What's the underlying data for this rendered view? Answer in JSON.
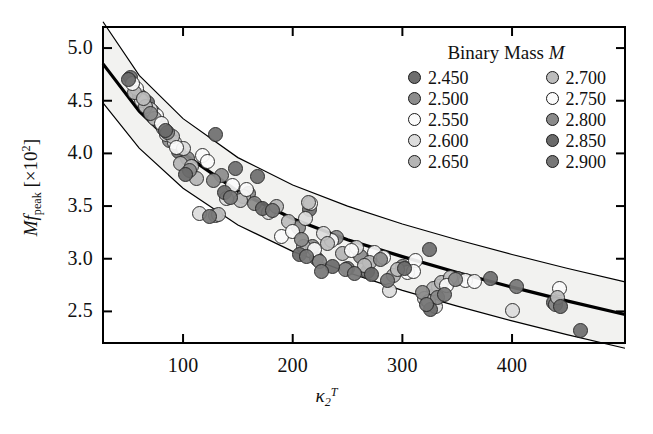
{
  "figure": {
    "background_color": "#ffffff",
    "frame_color": "#000000",
    "band_fill_color": "#f2f2f0",
    "fit_line_color": "#000000"
  },
  "axes": {
    "x": {
      "label_text": "κ",
      "label_sub": "2",
      "label_sup": "T",
      "ticks": [
        100,
        200,
        300,
        400
      ],
      "tick_labels": [
        "100",
        "200",
        "300",
        "400"
      ],
      "range": [
        27,
        503
      ]
    },
    "y": {
      "label_prefix": "M",
      "label_f": "f",
      "label_sub": "peak",
      "label_bracket_open": "[",
      "label_times": "×10",
      "label_exp": "2",
      "label_bracket_close": "]",
      "ticks": [
        2.5,
        3.0,
        3.5,
        4.0,
        4.5,
        5.0
      ],
      "tick_labels": [
        "2.5",
        "3.0",
        "3.5",
        "4.0",
        "4.5",
        "5.0"
      ],
      "range": [
        2.2,
        5.2
      ]
    }
  },
  "legend": {
    "title": "Binary Mass ",
    "title_italic": "M",
    "columns": [
      {
        "entries": [
          {
            "label": "2.450",
            "color": "#6e6e6e"
          },
          {
            "label": "2.500",
            "color": "#8c8c8c"
          },
          {
            "label": "2.550",
            "color": "#fbfbfb"
          },
          {
            "label": "2.600",
            "color": "#dddddd"
          },
          {
            "label": "2.650",
            "color": "#b5b5b5"
          }
        ]
      },
      {
        "entries": [
          {
            "label": "2.700",
            "color": "#bcbcbc"
          },
          {
            "label": "2.750",
            "color": "#fbfbfb"
          },
          {
            "label": "2.800",
            "color": "#8a8a8a"
          },
          {
            "label": "2.850",
            "color": "#6a6a6a"
          },
          {
            "label": "2.900",
            "color": "#777777"
          }
        ]
      }
    ]
  },
  "chart_data": {
    "type": "scatter",
    "title": "",
    "xlabel": "kappa_2^T",
    "ylabel": "M f_peak [x10^2]",
    "xlim": [
      27,
      503
    ],
    "ylim": [
      2.2,
      5.2
    ],
    "grid": false,
    "legend_position": "top-right",
    "legend_title": "Binary Mass M",
    "color_scale": "grayscale by binary mass M (solar masses)",
    "series": [
      {
        "name": "2.450",
        "color": "#6e6e6e",
        "points": [
          [
            52,
            4.72
          ],
          [
            68,
            4.48
          ],
          [
            78,
            4.3
          ],
          [
            96,
            4.02
          ],
          [
            130,
            4.18
          ],
          [
            148,
            3.86
          ],
          [
            168,
            3.78
          ],
          [
            215,
            3.47
          ],
          [
            222,
            3.0
          ],
          [
            250,
            2.91
          ],
          [
            268,
            2.88
          ],
          [
            325,
            3.09
          ],
          [
            380,
            2.81
          ],
          [
            438,
            2.58
          ],
          [
            462,
            2.32
          ]
        ]
      },
      {
        "name": "2.500",
        "color": "#8c8c8c",
        "points": [
          [
            60,
            4.55
          ],
          [
            72,
            4.4
          ],
          [
            88,
            4.12
          ],
          [
            104,
            3.95
          ],
          [
            135,
            3.79
          ],
          [
            160,
            3.62
          ],
          [
            205,
            3.3
          ],
          [
            218,
            3.12
          ],
          [
            240,
            3.2
          ],
          [
            262,
            3.02
          ],
          [
            300,
            2.93
          ],
          [
            330,
            2.66
          ],
          [
            350,
            2.81
          ],
          [
            440,
            2.57
          ]
        ]
      },
      {
        "name": "2.550",
        "color": "#fbfbfb",
        "points": [
          [
            58,
            4.62
          ],
          [
            76,
            4.36
          ],
          [
            92,
            4.1
          ],
          [
            118,
            3.98
          ],
          [
            145,
            3.7
          ],
          [
            190,
            3.21
          ],
          [
            216,
            3.52
          ],
          [
            235,
            3.17
          ],
          [
            275,
            3.06
          ],
          [
            305,
            2.87
          ],
          [
            312,
            2.98
          ],
          [
            333,
            2.74
          ],
          [
            358,
            2.79
          ],
          [
            443,
            2.72
          ]
        ]
      },
      {
        "name": "2.600",
        "color": "#dddddd",
        "points": [
          [
            62,
            4.5
          ],
          [
            70,
            4.42
          ],
          [
            85,
            4.18
          ],
          [
            100,
            4.05
          ],
          [
            115,
            3.43
          ],
          [
            140,
            3.57
          ],
          [
            178,
            3.44
          ],
          [
            212,
            3.38
          ],
          [
            228,
            3.24
          ],
          [
            258,
            3.11
          ],
          [
            288,
            2.7
          ],
          [
            320,
            2.62
          ],
          [
            330,
            2.55
          ],
          [
            400,
            2.51
          ]
        ]
      },
      {
        "name": "2.650",
        "color": "#b5b5b5",
        "points": [
          [
            56,
            4.58
          ],
          [
            66,
            4.45
          ],
          [
            82,
            4.24
          ],
          [
            98,
            3.9
          ],
          [
            112,
            3.76
          ],
          [
            130,
            3.41
          ],
          [
            155,
            3.59
          ],
          [
            185,
            3.5
          ],
          [
            210,
            3.12
          ],
          [
            245,
            3.05
          ],
          [
            270,
            2.96
          ],
          [
            292,
            2.84
          ],
          [
            328,
            2.72
          ],
          [
            336,
            2.77
          ]
        ]
      },
      {
        "name": "2.700",
        "color": "#bcbcbc",
        "points": [
          [
            64,
            4.52
          ],
          [
            74,
            4.33
          ],
          [
            90,
            4.16
          ],
          [
            108,
            3.88
          ],
          [
            132,
            3.42
          ],
          [
            152,
            3.55
          ],
          [
            196,
            3.35
          ],
          [
            214,
            3.53
          ],
          [
            232,
            3.14
          ],
          [
            265,
            2.94
          ],
          [
            296,
            2.9
          ],
          [
            324,
            2.59
          ],
          [
            344,
            2.82
          ],
          [
            441,
            2.63
          ]
        ]
      },
      {
        "name": "2.750",
        "color": "#fbfbfb",
        "points": [
          [
            54,
            4.66
          ],
          [
            80,
            4.28
          ],
          [
            94,
            4.06
          ],
          [
            122,
            3.92
          ],
          [
            158,
            3.66
          ],
          [
            200,
            3.26
          ],
          [
            220,
            3.09
          ],
          [
            254,
            3.08
          ],
          [
            283,
            3.01
          ],
          [
            310,
            2.88
          ],
          [
            340,
            2.75
          ],
          [
            366,
            2.78
          ]
        ]
      },
      {
        "name": "2.800",
        "color": "#8a8a8a",
        "points": [
          [
            70,
            4.38
          ],
          [
            86,
            4.2
          ],
          [
            106,
            3.84
          ],
          [
            128,
            3.74
          ],
          [
            165,
            3.52
          ],
          [
            208,
            3.18
          ],
          [
            224,
            2.97
          ],
          [
            248,
            2.9
          ],
          [
            280,
            2.99
          ],
          [
            318,
            2.68
          ],
          [
            332,
            2.63
          ],
          [
            348,
            2.8
          ]
        ]
      },
      {
        "name": "2.850",
        "color": "#6a6a6a",
        "points": [
          [
            50,
            4.7
          ],
          [
            84,
            4.22
          ],
          [
            102,
            3.8
          ],
          [
            138,
            3.63
          ],
          [
            172,
            3.48
          ],
          [
            206,
            3.04
          ],
          [
            236,
            2.93
          ],
          [
            272,
            2.85
          ],
          [
            302,
            2.91
          ],
          [
            326,
            2.52
          ],
          [
            444,
            2.55
          ]
        ]
      },
      {
        "name": "2.900",
        "color": "#777777",
        "points": [
          [
            124,
            3.4
          ],
          [
            143,
            3.58
          ],
          [
            182,
            3.46
          ],
          [
            213,
            3.02
          ],
          [
            226,
            2.88
          ],
          [
            256,
            2.86
          ],
          [
            286,
            2.79
          ],
          [
            322,
            2.57
          ],
          [
            338,
            2.66
          ],
          [
            404,
            2.74
          ]
        ]
      }
    ],
    "fit_curve": {
      "name": "best fit",
      "description": "monotonically decreasing fit line",
      "points": [
        [
          27,
          4.85
        ],
        [
          60,
          4.4
        ],
        [
          100,
          4.0
        ],
        [
          150,
          3.64
        ],
        [
          200,
          3.38
        ],
        [
          250,
          3.18
        ],
        [
          300,
          3.02
        ],
        [
          350,
          2.87
        ],
        [
          400,
          2.73
        ],
        [
          450,
          2.6
        ],
        [
          503,
          2.47
        ]
      ]
    },
    "confidence_band": {
      "name": "uncertainty band",
      "upper": [
        [
          27,
          5.25
        ],
        [
          60,
          4.74
        ],
        [
          100,
          4.33
        ],
        [
          150,
          3.96
        ],
        [
          200,
          3.7
        ],
        [
          250,
          3.5
        ],
        [
          300,
          3.33
        ],
        [
          350,
          3.18
        ],
        [
          400,
          3.04
        ],
        [
          450,
          2.91
        ],
        [
          503,
          2.78
        ]
      ],
      "lower": [
        [
          27,
          4.48
        ],
        [
          60,
          4.05
        ],
        [
          100,
          3.67
        ],
        [
          150,
          3.32
        ],
        [
          200,
          3.07
        ],
        [
          250,
          2.87
        ],
        [
          300,
          2.7
        ],
        [
          350,
          2.55
        ],
        [
          400,
          2.41
        ],
        [
          450,
          2.28
        ],
        [
          503,
          2.15
        ]
      ]
    }
  }
}
